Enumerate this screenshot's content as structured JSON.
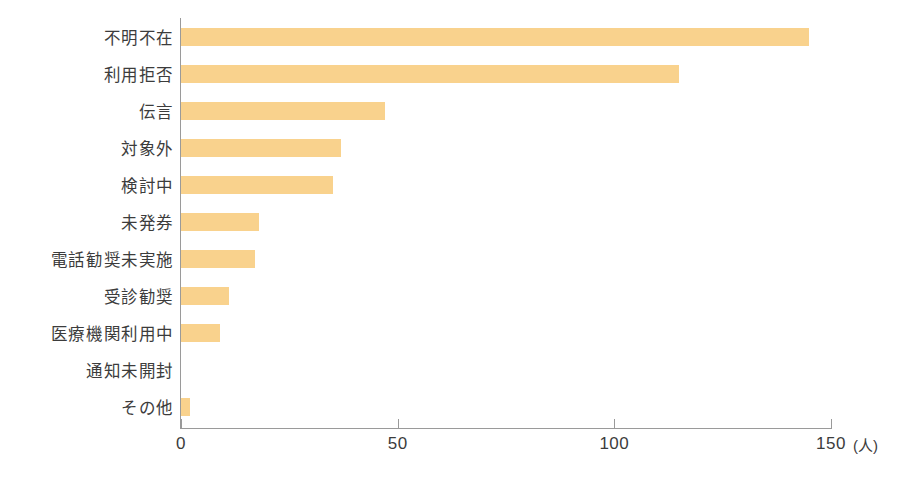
{
  "chart_data": {
    "type": "bar",
    "orientation": "horizontal",
    "title": "",
    "subtitle": "",
    "xlabel": "",
    "ylabel": "",
    "unit_label": "(人)",
    "categories": [
      "不明不在",
      "利用拒否",
      "伝言",
      "対象外",
      "検討中",
      "未発券",
      "電話勧奨未実施",
      "受診勧奨",
      "医療機関利用中",
      "通知未開封",
      "その他"
    ],
    "values": [
      145,
      115,
      47,
      37,
      35,
      18,
      17,
      11,
      9,
      0,
      2
    ],
    "xlim": [
      0,
      150
    ],
    "xticks": [
      0,
      50,
      100,
      150
    ],
    "xtick_labels": [
      "0",
      "50",
      "100",
      "150"
    ],
    "grid": false,
    "legend": false,
    "bar_color": "#f9d28d",
    "axis_color": "#9a9a9a",
    "text_color": "#3c3c3c"
  }
}
